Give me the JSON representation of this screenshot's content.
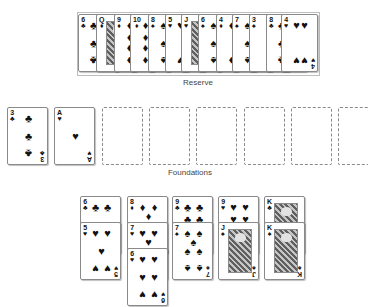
{
  "labels": {
    "reserve": "Reserve",
    "foundations": "Foundations"
  },
  "suits": {
    "clubs": "♣",
    "diamonds": "♦",
    "hearts": "♥",
    "spades": "♠"
  },
  "reserve": {
    "cards": [
      {
        "rank": "6",
        "suit": "clubs"
      },
      {
        "rank": "Q",
        "suit": "diamonds",
        "face": true
      },
      {
        "rank": "9",
        "suit": "diamonds"
      },
      {
        "rank": "10",
        "suit": "diamonds"
      },
      {
        "rank": "8",
        "suit": "spades"
      },
      {
        "rank": "5",
        "suit": "hearts"
      },
      {
        "rank": "J",
        "suit": "hearts",
        "face": true
      },
      {
        "rank": "6",
        "suit": "spades"
      },
      {
        "rank": "4",
        "suit": "diamonds"
      },
      {
        "rank": "7",
        "suit": "spades"
      },
      {
        "rank": "3",
        "suit": "spades"
      },
      {
        "rank": "8",
        "suit": "clubs"
      },
      {
        "rank": "4",
        "suit": "hearts"
      }
    ]
  },
  "foundations": {
    "slots": [
      {
        "rank": "3",
        "suit": "clubs"
      },
      {
        "rank": "A",
        "suit": "hearts"
      },
      null,
      null,
      null,
      null,
      null,
      null
    ]
  },
  "tableau": {
    "columns": [
      [
        {
          "rank": "6",
          "suit": "clubs"
        },
        {
          "rank": "5",
          "suit": "hearts"
        }
      ],
      [
        {
          "rank": "8",
          "suit": "diamonds"
        },
        {
          "rank": "7",
          "suit": "hearts"
        },
        {
          "rank": "6",
          "suit": "hearts"
        }
      ],
      [
        {
          "rank": "9",
          "suit": "clubs"
        },
        {
          "rank": "7",
          "suit": "spades"
        }
      ],
      [
        {
          "rank": "9",
          "suit": "hearts"
        },
        {
          "rank": "J",
          "suit": "spades",
          "face": true
        }
      ],
      [
        {
          "rank": "K",
          "suit": "clubs",
          "face": true
        },
        {
          "rank": "K",
          "suit": "spades",
          "face": true
        }
      ]
    ]
  }
}
